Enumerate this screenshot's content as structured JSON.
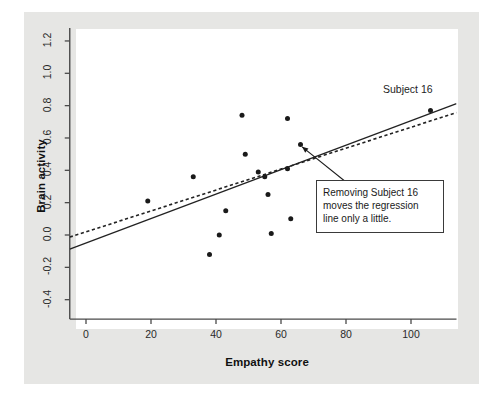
{
  "chart_data": {
    "type": "scatter",
    "title": "",
    "xlabel": "Empathy score",
    "ylabel": "Brain activity",
    "xlim": [
      -5,
      114
    ],
    "ylim": [
      -0.52,
      1.28
    ],
    "grid": false,
    "legend": null,
    "x_ticks": [
      "0",
      "20",
      "40",
      "60",
      "80",
      "100"
    ],
    "x_tick_values": [
      0,
      20,
      40,
      60,
      80,
      100
    ],
    "y_ticks": [
      "-0.4",
      "-0.2",
      "0.0",
      "0.2",
      "0.4",
      "0.6",
      "0.8",
      "1.0",
      "1.2"
    ],
    "y_tick_values": [
      -0.4,
      -0.2,
      0.0,
      0.2,
      0.4,
      0.6,
      0.8,
      1.0,
      1.2
    ],
    "points": [
      {
        "x": 19,
        "y": 0.21
      },
      {
        "x": 33,
        "y": 0.36
      },
      {
        "x": 38,
        "y": -0.12
      },
      {
        "x": 41,
        "y": 0.0
      },
      {
        "x": 43,
        "y": 0.15
      },
      {
        "x": 48,
        "y": 0.74
      },
      {
        "x": 49,
        "y": 0.5
      },
      {
        "x": 53,
        "y": 0.39
      },
      {
        "x": 55,
        "y": 0.36
      },
      {
        "x": 56,
        "y": 0.25
      },
      {
        "x": 57,
        "y": 0.01
      },
      {
        "x": 62,
        "y": 0.72
      },
      {
        "x": 62,
        "y": 0.41
      },
      {
        "x": 63,
        "y": 0.1
      },
      {
        "x": 66,
        "y": 0.56
      },
      {
        "x": 106,
        "y": 0.77
      }
    ],
    "point_color": "#1a1a1a",
    "lines": [
      {
        "name": "regression-all-subjects",
        "style": "solid",
        "color": "#222222",
        "x1": -5,
        "y1": -0.088,
        "x2": 114,
        "y2": 0.812
      },
      {
        "name": "regression-without-subject-16",
        "style": "dashed",
        "color": "#222222",
        "x1": -5,
        "y1": -0.013,
        "x2": 114,
        "y2": 0.757
      }
    ],
    "annotations": [
      {
        "name": "subject-16-label",
        "text": "Subject 16",
        "x": 99,
        "y": 0.9
      },
      {
        "name": "callout-note",
        "lines": [
          "Removing Subject 16",
          "moves the regression",
          "line only a little."
        ],
        "arrow_from_x": 82,
        "arrow_from_y": 0.295,
        "arrow_to_x": 66.5,
        "arrow_to_y": 0.545
      }
    ]
  },
  "colors": {
    "page_background": "#e6e6e4",
    "plot_background": "#ffffff",
    "axis": "#4a4a4a",
    "ink": "#1a1a1a",
    "outer_margin": "#ffffff"
  }
}
